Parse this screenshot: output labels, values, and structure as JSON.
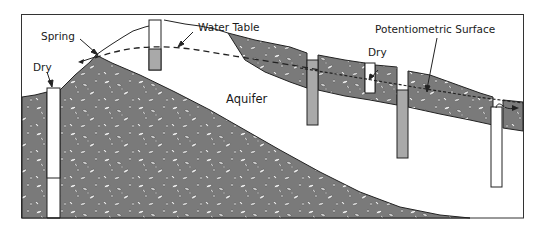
{
  "diagram": {
    "type": "groundwater cross-section",
    "labels": {
      "spring": "Spring",
      "dry_left": "Dry",
      "water_table": "Water Table",
      "aquifer": "Aquifer",
      "dry_right": "Dry",
      "potentiometric_surface": "Potentiometric Surface"
    },
    "colors": {
      "rock_fill": "#7a7a7a",
      "pebble": "#f2f2f2",
      "well_filled": "#a9a9a9",
      "well_empty": "#ffffff",
      "outline": "#222222",
      "frame": "#333333",
      "background": "#ffffff"
    },
    "wells": [
      {
        "name": "dry-well-left",
        "state": "dry"
      },
      {
        "name": "water-table-well",
        "state": "water"
      },
      {
        "name": "confined-well-1",
        "state": "water"
      },
      {
        "name": "dry-well-right",
        "state": "dry"
      },
      {
        "name": "confined-well-2",
        "state": "water"
      },
      {
        "name": "flowing-artesian-well",
        "state": "flowing"
      }
    ]
  }
}
